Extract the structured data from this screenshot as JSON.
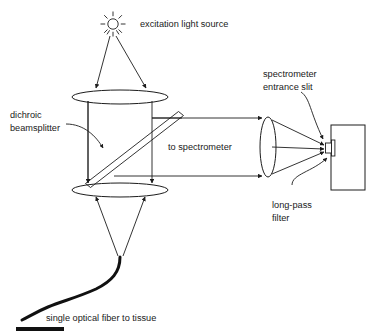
{
  "figure": {
    "background_color": "#ffffff",
    "line_color": "#1d1d1d",
    "text_color": "#1a1a1a"
  },
  "labels": {
    "excitation_light_source": "excitation light source",
    "dichroic_line1": "dichroic",
    "dichroic_line2": "beamsplitter",
    "to_spectrometer": "to spectrometer",
    "spectrometer_line1": "spectrometer",
    "spectrometer_line2": "entrance slit",
    "long_pass_line1": "long-pass",
    "long_pass_line2": "filter",
    "single_fiber": "single optical fiber to tissue"
  },
  "components": [
    {
      "name": "excitation-light-source",
      "kind": "lamp",
      "x": 113,
      "y": 24
    },
    {
      "name": "upper-lens",
      "kind": "lens-horizontal",
      "cx": 120,
      "cy": 97,
      "rx": 48,
      "ry": 7
    },
    {
      "name": "dichroic-beamsplitter",
      "kind": "slab-diagonal",
      "x1": 88,
      "y1": 182,
      "x2": 182,
      "y2": 113
    },
    {
      "name": "lower-lens",
      "kind": "lens-horizontal",
      "cx": 120,
      "cy": 190,
      "rx": 48,
      "ry": 7
    },
    {
      "name": "collection-lens",
      "kind": "lens-vertical",
      "cx": 268,
      "cy": 147,
      "rx": 8,
      "ry": 30
    },
    {
      "name": "spectrometer-body",
      "kind": "box",
      "x": 330,
      "y": 125,
      "w": 35,
      "h": 65
    },
    {
      "name": "entrance-slit",
      "kind": "slit",
      "x": 325,
      "y": 142,
      "w": 8,
      "h": 12
    },
    {
      "name": "long-pass-filter",
      "kind": "filter-plate",
      "x": 333,
      "y": 140,
      "w": 3,
      "h": 16
    },
    {
      "name": "optical-fiber",
      "kind": "fiber",
      "tip_x": 120,
      "tip_y": 258
    }
  ],
  "beams": {
    "source_to_lens": "Two diverging rays from the lamp down to the upper lens",
    "lens_to_beamsplitter": "Collimated vertical beam through the dichroic",
    "beamsplitter_to_spectrometer": "Horizontal beam pair to the collection lens",
    "lens_to_slit": "Converging rays onto the entrance slit",
    "lower_lens_to_fiber": "Converging rays onto the fiber tip"
  },
  "scale_bar": {
    "name": "scale-bar",
    "x": 16,
    "y": 325,
    "w": 48,
    "h": 4
  }
}
